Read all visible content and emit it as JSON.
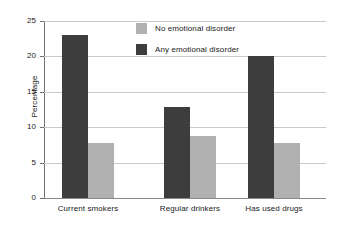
{
  "chart_data": {
    "type": "bar",
    "title": "",
    "xlabel": "",
    "ylabel": "Percentage",
    "ylim": [
      0,
      25
    ],
    "yticks": [
      0,
      5,
      10,
      15,
      20,
      25
    ],
    "ytick_labels": [
      "0",
      "5",
      "10",
      "15",
      "20",
      "25"
    ],
    "grid": true,
    "grid_axis": "y",
    "legend_position": "top-center-inside",
    "categories": [
      "Current smokers",
      "Regular drinkers",
      "Has used drugs"
    ],
    "series": [
      {
        "name": "No emotional disorder",
        "color": "#b0b0b0",
        "values": [
          7.8,
          8.7,
          7.7
        ]
      },
      {
        "name": "Any emotional disorder",
        "color": "#3d3d3d",
        "values": [
          23.0,
          12.8,
          20.0
        ]
      }
    ],
    "series_draw_order": [
      "Any emotional disorder",
      "No emotional disorder"
    ],
    "legend_entries": [
      "No emotional disorder",
      "Any emotional disorder"
    ]
  },
  "style": {
    "background": "#ffffff",
    "gridline_color": "#c9c9c9",
    "axis_color": "#6e6e6e",
    "baseline_color": "#8a8a8a",
    "text_color": "#1a1a1a"
  }
}
